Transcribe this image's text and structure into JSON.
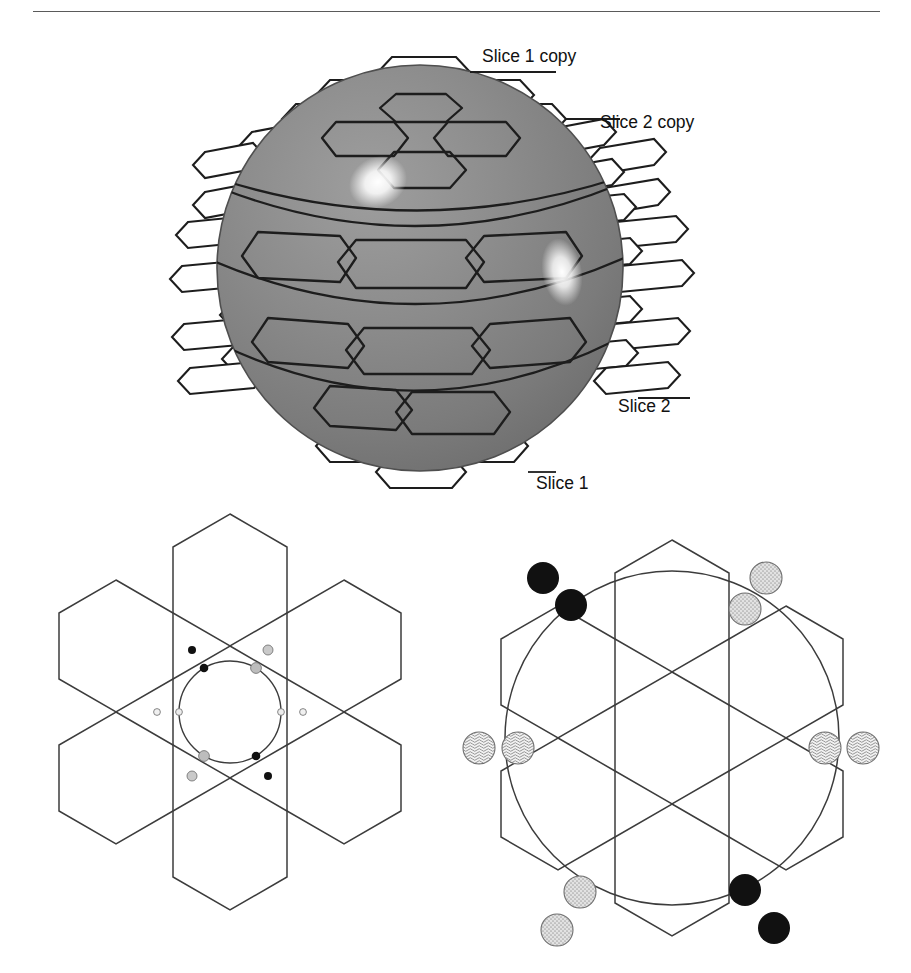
{
  "page": {
    "width": 911,
    "height": 973,
    "background": "#ffffff",
    "header_rule": {
      "present": true,
      "color": "#5a5a5a"
    }
  },
  "figure": {
    "kind": "geometry-diagram",
    "title_visible": false,
    "caption": {
      "text": "",
      "visible": false,
      "note": "caption row is clipped at the bottom edge of the page"
    },
    "panels": [
      {
        "id": "sphere-panel",
        "name": "hexagonally-tessellated-sphere",
        "description": "Shaded gray sphere covered by hexagonal tiles, with flattened hexagon strips peeled outward from each latitude band",
        "sphere": {
          "fill": "#8b8b8b",
          "shade_dark": "#6f6f6f",
          "shade_light": "#a6a6a6",
          "outline": "#4a4a4a",
          "highlights": 2,
          "highlight_color": "#ffffff",
          "pole_hexagon": true,
          "latitude_bands": 4
        },
        "labels": [
          {
            "id": "slice1copy",
            "text": "Slice 1 copy"
          },
          {
            "id": "slice2copy",
            "text": "Slice 2 copy"
          },
          {
            "id": "slice2",
            "text": "Slice 2"
          },
          {
            "id": "slice1",
            "text": "Slice 1"
          }
        ]
      },
      {
        "id": "left-panel",
        "name": "hexagon-cluster-with-inscribed-circle",
        "description": "Seven-hexagon flower cluster with a circle inscribed in the central hexagon; six paired marker dots sit on and just outside the circle",
        "hex_count": 7,
        "stroke": "#3c3c3c",
        "circle": {
          "stroke": "#3c3c3c",
          "fill": "none"
        },
        "markers": [
          {
            "angle_deg": 120,
            "on_circle": {
              "color": "#111111",
              "r": 4.2
            },
            "outside": {
              "color": "#111111",
              "r": 4.0
            }
          },
          {
            "angle_deg": 60,
            "on_circle": {
              "color": "#b8b8b8",
              "r": 5.2
            },
            "outside": {
              "color": "#c6c6c6",
              "r": 4.8
            }
          },
          {
            "angle_deg": 0,
            "on_circle": {
              "color": "#e6e6e6",
              "r": 3.2
            },
            "outside": {
              "color": "#ededed",
              "r": 3.2
            }
          },
          {
            "angle_deg": 300,
            "on_circle": {
              "color": "#111111",
              "r": 4.2
            },
            "outside": {
              "color": "#111111",
              "r": 4.0
            }
          },
          {
            "angle_deg": 240,
            "on_circle": {
              "color": "#b8b8b8",
              "r": 5.2
            },
            "outside": {
              "color": "#c6c6c6",
              "r": 4.8
            }
          },
          {
            "angle_deg": 180,
            "on_circle": {
              "color": "#e6e6e6",
              "r": 3.2
            },
            "outside": {
              "color": "#ededed",
              "r": 3.2
            }
          }
        ]
      },
      {
        "id": "right-panel",
        "name": "hexagon-cluster-with-circumscribed-circle",
        "description": "Seven-hexagon flower cluster overlaid by a large circle that crosses the outer hexagons; six paired large marker discs sit on and just outside the circle",
        "hex_count": 7,
        "stroke": "#3c3c3c",
        "circle": {
          "stroke": "#3c3c3c",
          "fill": "none"
        },
        "markers": [
          {
            "angle_deg": 127,
            "pattern": "solid-black",
            "on_circle": {
              "color": "#111111",
              "r": 16
            },
            "outside": {
              "color": "#111111",
              "r": 16
            }
          },
          {
            "angle_deg": 53,
            "pattern": "dotted-gray",
            "on_circle": {
              "color": "#c9c9c9",
              "r": 16
            },
            "outside": {
              "color": "#cfcfcf",
              "r": 16
            }
          },
          {
            "angle_deg": 0,
            "pattern": "wavy-hatch",
            "on_circle": {
              "color": "#e4e4e4",
              "r": 16
            },
            "outside": {
              "color": "#e9e9e9",
              "r": 16
            }
          },
          {
            "angle_deg": 307,
            "pattern": "solid-black",
            "on_circle": {
              "color": "#111111",
              "r": 16
            },
            "outside": {
              "color": "#111111",
              "r": 16
            }
          },
          {
            "angle_deg": 233,
            "pattern": "dotted-gray",
            "on_circle": {
              "color": "#c9c9c9",
              "r": 16
            },
            "outside": {
              "color": "#cfcfcf",
              "r": 16
            }
          },
          {
            "angle_deg": 180,
            "pattern": "wavy-hatch",
            "on_circle": {
              "color": "#e4e4e4",
              "r": 16
            },
            "outside": {
              "color": "#e9e9e9",
              "r": 16
            }
          }
        ]
      }
    ]
  }
}
